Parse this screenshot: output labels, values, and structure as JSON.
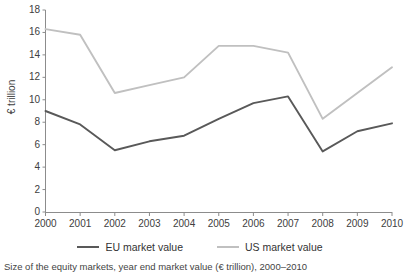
{
  "chart_data": {
    "type": "line",
    "title": "",
    "caption": "Size of the equity markets, year end market value (€ trillion), 2000–2010",
    "xlabel": "",
    "ylabel": "€ trillion",
    "categories": [
      "2000",
      "2001",
      "2002",
      "2003",
      "2004",
      "2005",
      "2006",
      "2007",
      "2008",
      "2009",
      "2010"
    ],
    "x": [
      2000,
      2001,
      2002,
      2003,
      2004,
      2005,
      2006,
      2007,
      2008,
      2009,
      2010
    ],
    "ylim": [
      0,
      18
    ],
    "xlim": [
      2000,
      2010
    ],
    "yticks": [
      0,
      2,
      4,
      6,
      8,
      10,
      12,
      14,
      16,
      18
    ],
    "ytick_labels": [
      "0",
      "2",
      "4",
      "6",
      "8",
      "10",
      "12",
      "14",
      "16",
      "18"
    ],
    "grid": false,
    "legend_position": "bottom",
    "series": [
      {
        "name": "EU market value",
        "color": "#595959",
        "values": [
          9.0,
          7.8,
          5.5,
          6.3,
          6.8,
          8.3,
          9.7,
          10.3,
          5.4,
          7.2,
          7.9
        ]
      },
      {
        "name": "US market value",
        "color": "#c0c0c0",
        "values": [
          16.3,
          15.8,
          10.6,
          11.3,
          12.0,
          14.8,
          14.8,
          14.2,
          8.3,
          10.6,
          12.9
        ]
      }
    ]
  },
  "axes": {
    "y_title": "€ trillion",
    "y_tick_labels": [
      "18",
      "16",
      "14",
      "12",
      "10",
      "8",
      "6",
      "4",
      "2",
      "0"
    ],
    "x_tick_labels": [
      "2000",
      "2001",
      "2002",
      "2003",
      "2004",
      "2005",
      "2006",
      "2007",
      "2008",
      "2009",
      "2010"
    ]
  },
  "legend": {
    "items": [
      {
        "label": "EU market value",
        "color": "#595959"
      },
      {
        "label": "US market value",
        "color": "#c0c0c0"
      }
    ]
  },
  "caption": {
    "text": "Size of the equity markets, year end market value (€ trillion), 2000–2010"
  },
  "colors": {
    "eu_line": "#595959",
    "us_line": "#c0c0c0",
    "axis": "#7f7f7f",
    "text": "#404040",
    "background": "#ffffff"
  }
}
